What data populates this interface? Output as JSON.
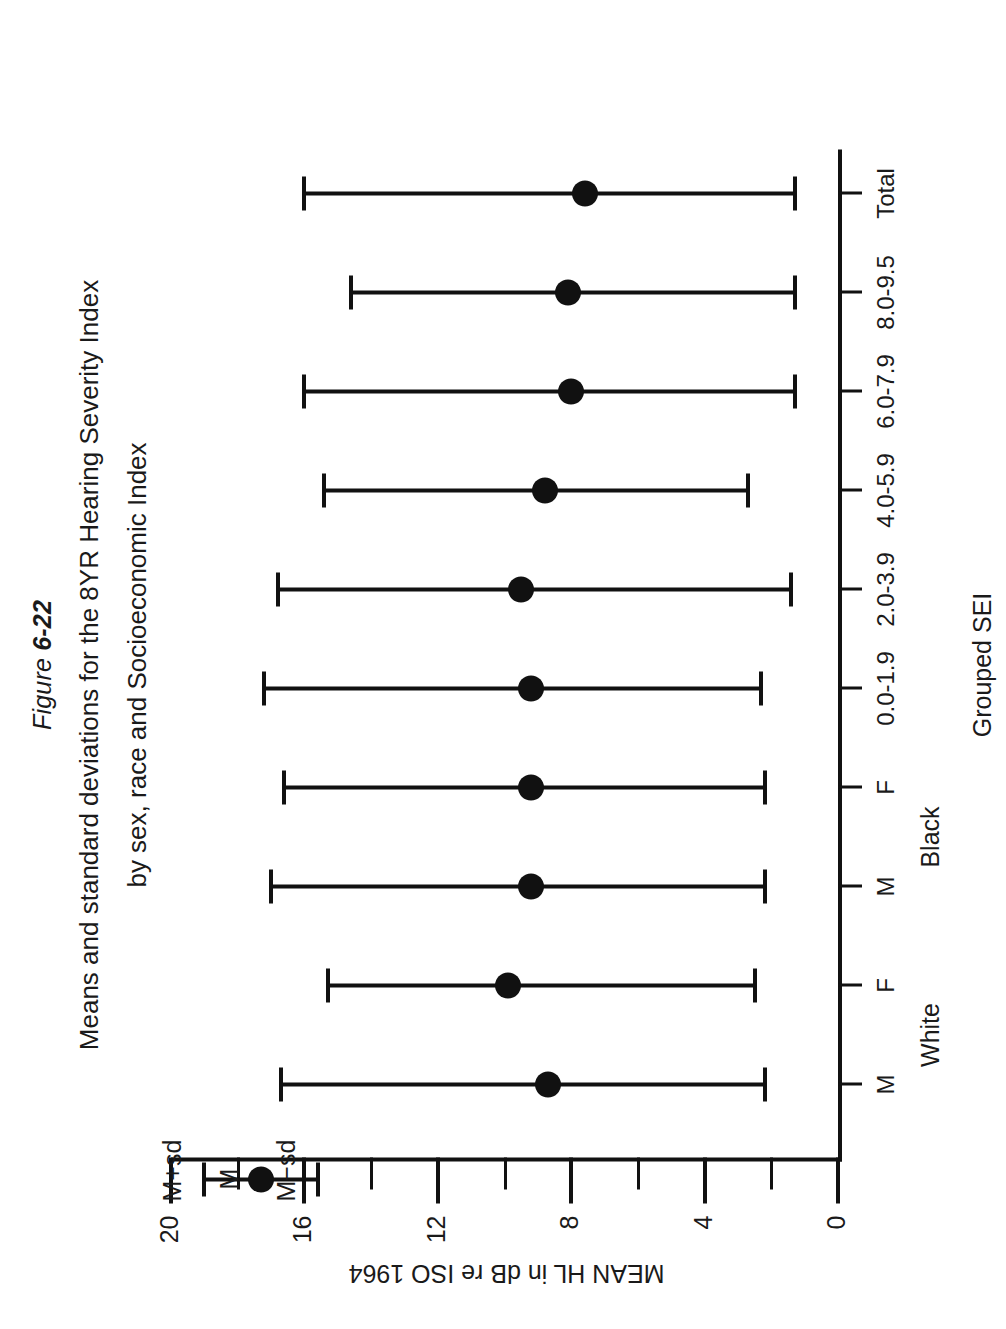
{
  "figure": {
    "number_prefix": "Figure ",
    "number": "6-22",
    "caption_line1": "Means and standard deviations for the 8YR Hearing Severity Index",
    "caption_line2": "by sex, race and Socioeconomic Index"
  },
  "axes": {
    "value_axis_title": "MEAN HL in dB re ISO 1964",
    "value_ticks": [
      "20",
      "16",
      "12",
      "8",
      "4",
      "0"
    ],
    "value_tick_values": [
      20,
      16,
      12,
      8,
      4,
      0
    ],
    "minor_tick_values": [
      18,
      14,
      10,
      6,
      2
    ],
    "value_min": 0,
    "value_max": 20,
    "category_axis_title": "Grouped SEI"
  },
  "key": {
    "upper_label": "M+sd",
    "mean_label": "M",
    "lower_label": "M−sd"
  },
  "group_labels": [
    {
      "text": "White",
      "center_index": 0.5
    },
    {
      "text": "Black",
      "center_index": 2.5
    }
  ],
  "colors": {
    "ink": "#111111",
    "paper": "#ffffff"
  },
  "chart_data": {
    "type": "line",
    "title": "Means and standard deviations for the 8YR Hearing Severity Index by sex, race and Socioeconomic Index",
    "xlabel": "Grouped SEI",
    "ylabel": "MEAN HL in dB re ISO 1964",
    "ylim": [
      0,
      20
    ],
    "grid": false,
    "legend": "key at top-left: M+sd / M / M−sd",
    "categories": [
      "M",
      "F",
      "M",
      "F",
      "0.0-1.9",
      "2.0-3.9",
      "4.0-5.9",
      "6.0-7.9",
      "8.0-9.5",
      "Total"
    ],
    "series": [
      {
        "name": "mean",
        "values": [
          8.7,
          9.9,
          9.2,
          9.2,
          9.2,
          9.5,
          8.8,
          8.0,
          8.1,
          7.6
        ]
      },
      {
        "name": "mean_minus_sd",
        "values": [
          2.2,
          2.5,
          2.2,
          2.2,
          2.3,
          1.4,
          2.7,
          1.3,
          1.3,
          1.3
        ]
      },
      {
        "name": "mean_plus_sd",
        "values": [
          16.7,
          15.3,
          17.0,
          16.6,
          17.2,
          16.8,
          15.4,
          16.0,
          14.6,
          16.0
        ]
      }
    ]
  }
}
